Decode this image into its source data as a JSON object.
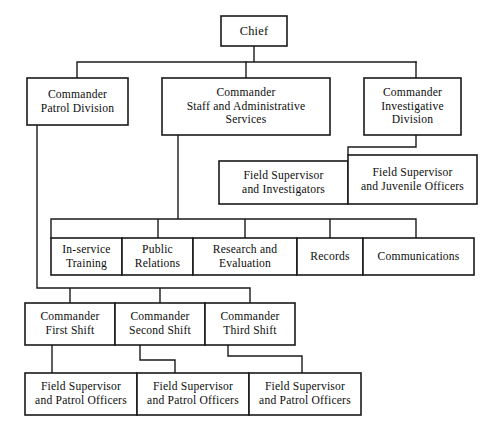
{
  "chart_data": {
    "type": "diagram",
    "orientation": "top-down",
    "nodes": [
      {
        "id": "chief",
        "label": "Chief",
        "lines": [
          "Chief"
        ],
        "level": 0,
        "x": 221,
        "y": 16,
        "w": 66,
        "h": 30,
        "size": "sz-13"
      },
      {
        "id": "cmd-patrol",
        "label": "Commander Patrol Division",
        "lines": [
          "Commander",
          "Patrol Division"
        ],
        "level": 1,
        "x": 27,
        "y": 78,
        "w": 101,
        "h": 47,
        "size": "sz-12"
      },
      {
        "id": "cmd-staff",
        "label": "Commander Staff and Administrative Services",
        "lines": [
          "Commander",
          "Staff and Administrative",
          "Services"
        ],
        "level": 1,
        "x": 162,
        "y": 78,
        "w": 168,
        "h": 57,
        "size": "sz-12"
      },
      {
        "id": "cmd-invest",
        "label": "Commander Investigative Division",
        "lines": [
          "Commander",
          "Investigative",
          "Division"
        ],
        "level": 1,
        "x": 364,
        "y": 78,
        "w": 97,
        "h": 57,
        "size": "sz-12"
      },
      {
        "id": "fs-invest",
        "label": "Field Supervisor and Investigators",
        "lines": [
          "Field Supervisor",
          "and Investigators"
        ],
        "level": 2,
        "x": 219,
        "y": 161,
        "w": 129,
        "h": 43,
        "size": "sz-12"
      },
      {
        "id": "fs-juvenile",
        "label": "Field Supervisor and Juvenile Officers",
        "lines": [
          "Field Supervisor",
          "and Juvenile Officers"
        ],
        "level": 2,
        "x": 348,
        "y": 155,
        "w": 129,
        "h": 49,
        "size": "sz-12"
      },
      {
        "id": "in-service",
        "label": "In-service Training",
        "lines": [
          "In-service",
          "Training"
        ],
        "level": 2,
        "x": 51,
        "y": 238,
        "w": 71,
        "h": 37,
        "size": "sz-12"
      },
      {
        "id": "public-rel",
        "label": "Public Relations",
        "lines": [
          "Public",
          "Relations"
        ],
        "level": 2,
        "x": 122,
        "y": 238,
        "w": 71,
        "h": 37,
        "size": "sz-12"
      },
      {
        "id": "research",
        "label": "Research and Evaluation",
        "lines": [
          "Research and",
          "Evaluation"
        ],
        "level": 2,
        "x": 193,
        "y": 238,
        "w": 104,
        "h": 37,
        "size": "sz-12"
      },
      {
        "id": "records",
        "label": "Records",
        "lines": [
          "Records"
        ],
        "level": 2,
        "x": 297,
        "y": 238,
        "w": 66,
        "h": 37,
        "size": "sz-12"
      },
      {
        "id": "communications",
        "label": "Communications",
        "lines": [
          "Communications"
        ],
        "level": 2,
        "x": 363,
        "y": 238,
        "w": 111,
        "h": 37,
        "size": "sz-12"
      },
      {
        "id": "cmd-first",
        "label": "Commander First Shift",
        "lines": [
          "Commander",
          "First Shift"
        ],
        "level": 3,
        "x": 25,
        "y": 303,
        "w": 90,
        "h": 42,
        "size": "sz-12"
      },
      {
        "id": "cmd-second",
        "label": "Commander Second Shift",
        "lines": [
          "Commander",
          "Second Shift"
        ],
        "level": 3,
        "x": 115,
        "y": 303,
        "w": 90,
        "h": 42,
        "size": "sz-12"
      },
      {
        "id": "cmd-third",
        "label": "Commander Third Shift",
        "lines": [
          "Commander",
          "Third Shift"
        ],
        "level": 3,
        "x": 205,
        "y": 303,
        "w": 90,
        "h": 42,
        "size": "sz-12"
      },
      {
        "id": "fs-patrol-1",
        "label": "Field Supervisor and Patrol Officers",
        "lines": [
          "Field Supervisor",
          "and Patrol Officers"
        ],
        "level": 4,
        "x": 25,
        "y": 373,
        "w": 112,
        "h": 42,
        "size": "sz-12"
      },
      {
        "id": "fs-patrol-2",
        "label": "Field Supervisor and Patrol Officers",
        "lines": [
          "Field Supervisor",
          "and Patrol Officers"
        ],
        "level": 4,
        "x": 137,
        "y": 373,
        "w": 112,
        "h": 42,
        "size": "sz-12"
      },
      {
        "id": "fs-patrol-3",
        "label": "Field Supervisor and Patrol Officers",
        "lines": [
          "Field Supervisor",
          "and Patrol Officers"
        ],
        "level": 4,
        "x": 249,
        "y": 373,
        "w": 112,
        "h": 42,
        "size": "sz-12"
      }
    ],
    "edges": [
      {
        "from": "chief",
        "to": "cmd-patrol",
        "path": "M254,46 L254,62 M77,62 L416,62 M77,62 L77,78"
      },
      {
        "from": "chief",
        "to": "cmd-staff",
        "path": "M246,62 L246,78"
      },
      {
        "from": "chief",
        "to": "cmd-invest",
        "path": "M416,62 L416,78"
      },
      {
        "from": "cmd-invest",
        "to": "fs-juvenile",
        "path": "M416,135 L416,147 M348,147 L416,147 M348,147 L348,155"
      },
      {
        "from": "cmd-staff",
        "to": "staff-units",
        "path": "M178,135 L178,219 M51,219 L416,219 M51,219 L51,238 M158,219 L158,238 M245,219 L245,238 M330,219 L330,238 M416,219 L416,238"
      },
      {
        "from": "cmd-patrol",
        "to": "shift-commanders",
        "path": "M37,125 L37,288 M37,288 L250,288 M70,288 L70,303 M160,288 L160,303 M250,288 L250,303"
      },
      {
        "from": "cmd-first",
        "to": "fs-patrol-1",
        "path": "M52,345 L52,373"
      },
      {
        "from": "cmd-second",
        "to": "fs-patrol-2",
        "path": "M140,345 L140,360 M140,360 L175,360 M175,360 L175,373"
      },
      {
        "from": "cmd-third",
        "to": "fs-patrol-3",
        "path": "M228,345 L228,356 M228,356 L302,356 M302,356 L302,373"
      }
    ],
    "colors": {
      "box_fill": "#ffffff",
      "box_stroke": "#1a1a1a",
      "connector": "#1a1a1a",
      "text": "#0d0d0d",
      "background": "#ffffff"
    }
  }
}
